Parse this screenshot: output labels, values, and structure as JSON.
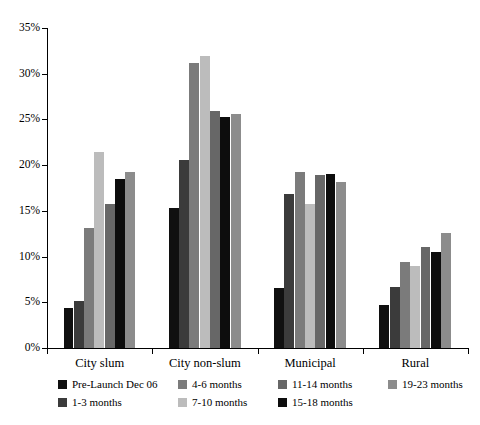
{
  "chart_data": {
    "type": "bar",
    "title": "",
    "xlabel": "",
    "ylabel": "",
    "ylim": [
      0,
      35
    ],
    "ytick_labels": [
      "0%",
      "5%",
      "10%",
      "15%",
      "20%",
      "25%",
      "30%",
      "35%"
    ],
    "ytick_values": [
      0,
      5,
      10,
      15,
      20,
      25,
      30,
      35
    ],
    "grid": false,
    "legend_position": "bottom",
    "categories": [
      "City slum",
      "City non-slum",
      "Municipal",
      "Rural"
    ],
    "series": [
      {
        "name": "Pre-Launch Dec 06",
        "color": "#101010",
        "values": [
          4.4,
          15.3,
          6.6,
          4.7
        ]
      },
      {
        "name": "1-3 months",
        "color": "#3b3b3b",
        "values": [
          5.1,
          20.6,
          16.8,
          6.7
        ]
      },
      {
        "name": "4-6 months",
        "color": "#7b7b7b",
        "values": [
          13.1,
          31.2,
          19.3,
          9.4
        ]
      },
      {
        "name": "7-10 months",
        "color": "#bcbcbc",
        "values": [
          21.4,
          31.9,
          15.7,
          9.0
        ]
      },
      {
        "name": "11-14 months",
        "color": "#676767",
        "values": [
          15.8,
          25.9,
          18.9,
          11.1
        ]
      },
      {
        "name": "15-18 months",
        "color": "#0d0d0d",
        "values": [
          18.5,
          25.3,
          19.0,
          10.5
        ]
      },
      {
        "name": "19-23 months",
        "color": "#8c8c8c",
        "values": [
          19.2,
          25.6,
          18.2,
          12.6
        ]
      }
    ]
  },
  "legend": {
    "entries": [
      {
        "label": "Pre-Launch Dec 06",
        "color": "#101010"
      },
      {
        "label": "1-3 months",
        "color": "#3b3b3b"
      },
      {
        "label": "4-6 months",
        "color": "#7b7b7b"
      },
      {
        "label": "7-10 months",
        "color": "#bcbcbc"
      },
      {
        "label": "11-14 months",
        "color": "#676767"
      },
      {
        "label": "15-18 months",
        "color": "#0d0d0d"
      },
      {
        "label": "19-23 months",
        "color": "#8c8c8c"
      }
    ]
  }
}
